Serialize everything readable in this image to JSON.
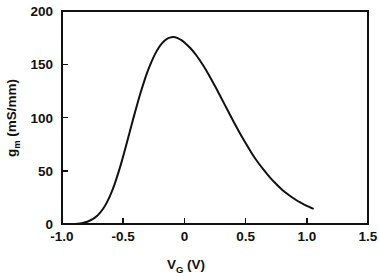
{
  "chart_data": {
    "type": "line",
    "title": "",
    "subtitle": "",
    "xlabel": "V_G (V)",
    "xlabel_main": "V",
    "xlabel_sub": "G",
    "xlabel_unit": "(V)",
    "ylabel": "g_m (mS/mm)",
    "ylabel_main": "g",
    "ylabel_sub": "m",
    "ylabel_unit": "(mS/mm)",
    "xlim": [
      -1.0,
      1.5
    ],
    "ylim": [
      0,
      200
    ],
    "xticks": [
      -1.0,
      -0.5,
      0,
      0.5,
      1.0,
      1.5
    ],
    "xticklabels": [
      "-1.0",
      "-0.5",
      "0",
      "0.5",
      "1.0",
      "1.5"
    ],
    "yticks": [
      0,
      50,
      100,
      150,
      200
    ],
    "yticklabels": [
      "0",
      "50",
      "100",
      "150",
      "200"
    ],
    "grid": false,
    "legend": null,
    "series": [
      {
        "name": "transconductance",
        "x": [
          -0.9,
          -0.87,
          -0.84,
          -0.81,
          -0.78,
          -0.75,
          -0.72,
          -0.69,
          -0.66,
          -0.63,
          -0.6,
          -0.57,
          -0.54,
          -0.51,
          -0.48,
          -0.45,
          -0.42,
          -0.39,
          -0.36,
          -0.33,
          -0.3,
          -0.27,
          -0.24,
          -0.21,
          -0.18,
          -0.15,
          -0.12,
          -0.09,
          -0.06,
          -0.03,
          0.0,
          0.05,
          0.1,
          0.15,
          0.2,
          0.25,
          0.3,
          0.35,
          0.4,
          0.45,
          0.5,
          0.55,
          0.6,
          0.65,
          0.7,
          0.75,
          0.8,
          0.85,
          0.9,
          0.95,
          1.0,
          1.05
        ],
        "y": [
          0.0,
          0.3,
          0.8,
          1.6,
          2.8,
          4.5,
          7.0,
          10.5,
          15.0,
          21.0,
          28.5,
          37.5,
          48.0,
          59.5,
          72.0,
          85.0,
          98.0,
          110.5,
          122.5,
          133.5,
          143.5,
          152.0,
          159.5,
          165.5,
          170.0,
          173.2,
          175.0,
          175.5,
          174.8,
          173.0,
          170.5,
          165.0,
          158.0,
          149.5,
          140.0,
          129.5,
          118.5,
          107.5,
          96.5,
          86.0,
          76.0,
          66.5,
          58.0,
          50.5,
          43.5,
          37.5,
          32.0,
          27.5,
          23.5,
          20.0,
          17.0,
          14.5
        ]
      }
    ],
    "peak": {
      "x": -0.09,
      "y": 175.5
    },
    "axis_frame": {
      "left": true,
      "right": true,
      "top": true,
      "bottom": true
    }
  }
}
